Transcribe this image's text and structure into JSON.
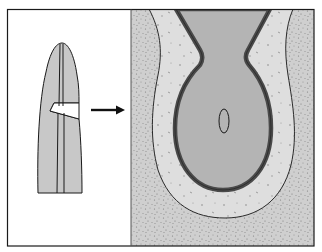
{
  "figure": {
    "panels": [
      {
        "id": "left",
        "label": "overview-tip-with-notch"
      },
      {
        "id": "right",
        "label": "magnified-section"
      }
    ],
    "arrow": {
      "direction": "right"
    },
    "colors": {
      "frame": "#1a1a1a",
      "panel_left_bg": "#ffffff",
      "tip_fill": "#c8c8c8",
      "outer_stipple_bg": "#cfcfcf",
      "middle_layer": "#dedede",
      "cavity_wall": "#4a4a4a",
      "cavity_fill": "#b4b4b4",
      "dots": "#8a8a8a"
    }
  }
}
